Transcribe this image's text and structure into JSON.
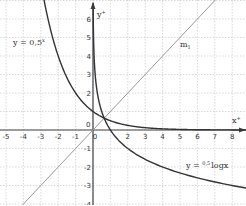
{
  "chart_data": {
    "type": "line",
    "title": "",
    "xlabel": "x",
    "ylabel": "y",
    "xlim": [
      -5.3,
      8.7
    ],
    "ylim": [
      -4.1,
      7.0
    ],
    "grid": true,
    "x_ticks": [
      -5,
      -4,
      -3,
      -2,
      -1,
      0,
      1,
      2,
      3,
      4,
      5,
      6,
      7,
      8
    ],
    "x_tick_labels": [
      "-5",
      "-4",
      "-3",
      "-2",
      "-1",
      "0",
      "",
      "2",
      "3",
      "4",
      "5",
      "6",
      "7",
      "8"
    ],
    "y_ticks": [
      -4,
      -3,
      -2,
      -1,
      0,
      1,
      2,
      3,
      4,
      5,
      6
    ],
    "y_tick_labels": [
      "-4",
      "-3",
      "-2",
      "-1",
      "0",
      "",
      "2",
      "3",
      "4",
      "5",
      "6"
    ],
    "origin_label": "0",
    "series": [
      {
        "name": "y = 0.5^x",
        "function": "0.5^x",
        "color": "#333333"
      },
      {
        "name": "y = 0.5 log x",
        "function": "log_0.5(x)",
        "color": "#333333"
      },
      {
        "name": "m1",
        "function": "x",
        "color": "#999999"
      }
    ],
    "annotations": [
      {
        "text": "y = 0,5ˣ",
        "x": -4.0,
        "y": 5.0
      },
      {
        "text": "m₁",
        "x": 4.4,
        "y": 4.9
      },
      {
        "text": "y = ⁰·⁵ logx",
        "x": 5.5,
        "y": -2.2
      },
      {
        "text": "x⁺",
        "x": 8.0,
        "y": 0.5
      },
      {
        "text": "y⁺",
        "x": 0.4,
        "y": 6.1
      }
    ]
  },
  "labels": {
    "exp_curve": "y = 0,5",
    "exp_sup": "x",
    "log_curve_pre": "y = ",
    "log_curve_sup": "0,5",
    "log_curve_post": "logx",
    "line": "m",
    "line_sub": "1",
    "x_axis": "x",
    "y_axis": "y",
    "origin": "0"
  }
}
